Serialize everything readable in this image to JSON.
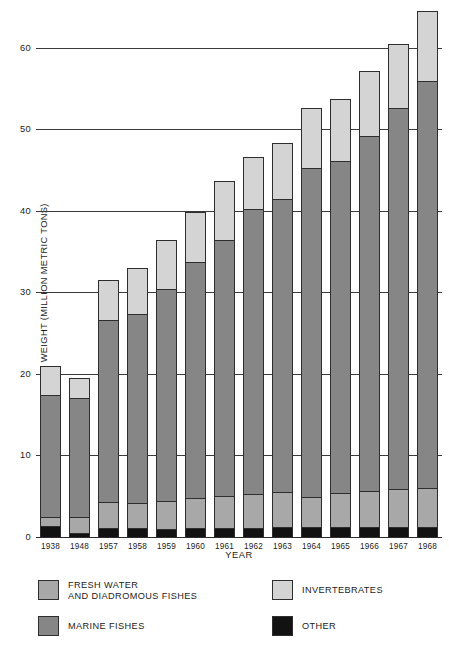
{
  "chart_data": {
    "type": "bar",
    "subtype": "stacked-bar",
    "title": "",
    "xlabel": "YEAR",
    "ylabel": "LIVE WEIGHT (MILLION METRIC TONS)",
    "ylim": [
      0,
      65
    ],
    "yticks": [
      10,
      20,
      30,
      40,
      50,
      60
    ],
    "grid": true,
    "legend_position": "bottom",
    "categories": [
      "1938",
      "1948",
      "1957",
      "1958",
      "1959",
      "1960",
      "1961",
      "1962",
      "1963",
      "1964",
      "1965",
      "1966",
      "1967",
      "1968"
    ],
    "stack_order_bottom_to_top": [
      "OTHER",
      "FRESH WATER AND DIADROMOUS FISHES",
      "MARINE FISHES",
      "INVERTEBRATES"
    ],
    "series": [
      {
        "name": "OTHER",
        "color": "#121212",
        "values": [
          1.5,
          0.6,
          1.2,
          1.2,
          1.1,
          1.2,
          1.2,
          1.2,
          1.3,
          1.3,
          1.3,
          1.4,
          1.3,
          1.4
        ]
      },
      {
        "name": "FRESH WATER AND DIADROMOUS FISHES",
        "color": "#a8a8a8",
        "values": [
          1.1,
          2.0,
          3.2,
          3.1,
          3.5,
          3.7,
          3.9,
          4.2,
          4.3,
          3.7,
          4.2,
          4.4,
          4.7,
          4.7
        ]
      },
      {
        "name": "MARINE FISHES",
        "color": "#868686",
        "values": [
          14.9,
          14.6,
          22.3,
          23.2,
          25.9,
          28.9,
          31.4,
          34.9,
          36.0,
          40.4,
          40.7,
          43.5,
          46.7,
          49.9
        ]
      },
      {
        "name": "INVERTEBRATES",
        "color": "#d4d4d4",
        "values": [
          3.6,
          2.4,
          4.9,
          5.6,
          6.1,
          6.2,
          7.3,
          6.4,
          6.9,
          7.4,
          7.7,
          8.0,
          7.9,
          8.6
        ]
      }
    ],
    "totals": [
      21.1,
      19.6,
      31.6,
      33.1,
      36.6,
      40.0,
      43.8,
      46.7,
      48.5,
      52.8,
      53.9,
      57.3,
      60.6,
      64.6
    ]
  },
  "legend": {
    "items": [
      {
        "key": "freshwater",
        "label": "FRESH WATER\nAND DIADROMOUS FISHES",
        "color": "#a8a8a8"
      },
      {
        "key": "invertebrates",
        "label": "INVERTEBRATES",
        "color": "#d4d4d4"
      },
      {
        "key": "marine",
        "label": "MARINE FISHES",
        "color": "#868686"
      },
      {
        "key": "other",
        "label": "OTHER",
        "color": "#121212"
      }
    ]
  },
  "axes": {
    "y_title": "LIVE WEIGHT (MILLION METRIC TONS)",
    "x_title": "YEAR",
    "y_tick_labels": [
      "60",
      "50",
      "40",
      "30",
      "20",
      "10",
      "0"
    ]
  },
  "caption": ""
}
